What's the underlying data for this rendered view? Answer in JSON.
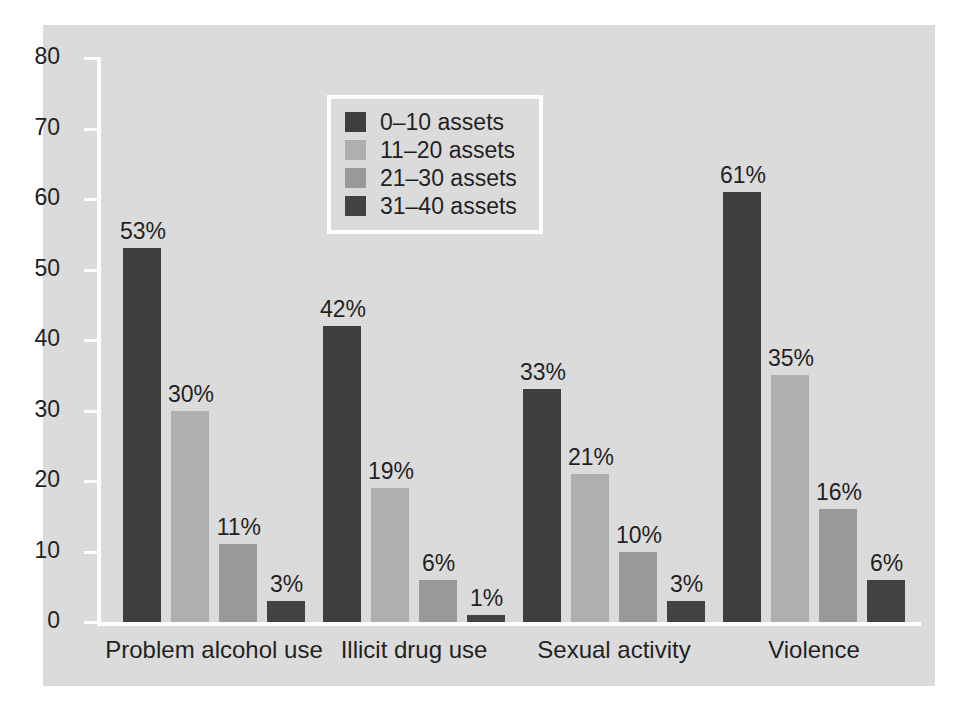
{
  "chart_data": {
    "type": "bar",
    "title": "",
    "subtitle": "",
    "xlabel": "",
    "ylabel": "",
    "ylim": [
      0,
      80
    ],
    "ytick_step": 10,
    "yticks": [
      "80",
      "70",
      "60",
      "50",
      "40",
      "30",
      "20",
      "10",
      "0"
    ],
    "grid": false,
    "legend_position": "top-center-inside",
    "value_label_suffix": "%",
    "categories": [
      "Problem alcohol use",
      "Illicit drug use",
      "Sexual activity",
      "Violence"
    ],
    "series": [
      {
        "name": "0–10 assets",
        "color": "#3b3b3b",
        "values": [
          53,
          42,
          33,
          61
        ],
        "labels": [
          "53%",
          "42%",
          "33%",
          "61%"
        ]
      },
      {
        "name": "11–20 assets",
        "color": "#aeaeae",
        "values": [
          30,
          19,
          21,
          35
        ],
        "labels": [
          "30%",
          "19%",
          "21%",
          "35%"
        ]
      },
      {
        "name": "21–30 assets",
        "color": "#989898",
        "values": [
          11,
          6,
          10,
          16
        ],
        "labels": [
          "11%",
          "6%",
          "10%",
          "16%"
        ]
      },
      {
        "name": "31–40 assets",
        "color": "#3f3f3f",
        "values": [
          3,
          1,
          3,
          6
        ],
        "labels": [
          "3%",
          "1%",
          "3%",
          "6%"
        ]
      }
    ]
  },
  "figure": {
    "panel_background": "#dcdcdc",
    "page_background": "#ffffff",
    "axis_color": "#ffffff",
    "text_color": "#1c1c1c"
  },
  "legend": {
    "border_color": "#ffffff",
    "entries": [
      {
        "label": "0–10 assets",
        "color": "#3b3b3b"
      },
      {
        "label": "11–20 assets",
        "color": "#aeaeae"
      },
      {
        "label": "21–30 assets",
        "color": "#989898"
      },
      {
        "label": "31–40 assets",
        "color": "#3f3f3f"
      }
    ]
  }
}
